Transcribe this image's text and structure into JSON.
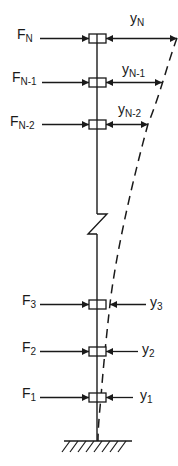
{
  "diagram": {
    "colors": {
      "ink": "#1a1a1a",
      "background": "#ffffff"
    },
    "levels": [
      {
        "id": "N",
        "force_base": "F",
        "force_sub": "N",
        "disp_base": "y",
        "disp_sub": "N",
        "disp_side": "right"
      },
      {
        "id": "N-1",
        "force_base": "F",
        "force_sub": "N-1",
        "disp_base": "y",
        "disp_sub": "N-1",
        "disp_side": "right"
      },
      {
        "id": "N-2",
        "force_base": "F",
        "force_sub": "N-2",
        "disp_base": "y",
        "disp_sub": "N-2",
        "disp_side": "right"
      },
      {
        "id": "3",
        "force_base": "F",
        "force_sub": "3",
        "disp_base": "y",
        "disp_sub": "3",
        "disp_side": "outside"
      },
      {
        "id": "2",
        "force_base": "F",
        "force_sub": "2",
        "disp_base": "y",
        "disp_sub": "2",
        "disp_side": "outside"
      },
      {
        "id": "1",
        "force_base": "F",
        "force_sub": "1",
        "disp_base": "y",
        "disp_sub": "1",
        "disp_side": "outside"
      }
    ],
    "elements": {
      "column": "vertical column",
      "break": "zigzag break symbol",
      "deflected_shape": "dashed deflection curve",
      "support": "fixed ground support"
    }
  }
}
